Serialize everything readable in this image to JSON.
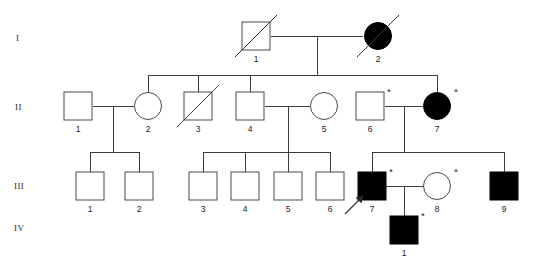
{
  "generation_labels": [
    {
      "id": "gen-I",
      "text": "I",
      "x": 16,
      "y": 41
    },
    {
      "id": "gen-II",
      "text": "II",
      "x": 15,
      "y": 110
    },
    {
      "id": "gen-III",
      "text": "III",
      "x": 14,
      "y": 189
    },
    {
      "id": "gen-IV",
      "text": "IV",
      "x": 14,
      "y": 231
    }
  ],
  "legend": {
    "affected_fill": "#000000",
    "unaffected_fill": "#ffffff",
    "line_color": "#3c3c3c",
    "asterisk_symbol": "*"
  },
  "individuals": [
    {
      "name": "I-1",
      "generation": "I",
      "id_label": "1",
      "sex": "male",
      "affected": false,
      "deceased": true,
      "asterisk": false,
      "proband": false,
      "cx": 256,
      "cy": 36
    },
    {
      "name": "I-2",
      "generation": "I",
      "id_label": "2",
      "sex": "female",
      "affected": true,
      "deceased": true,
      "asterisk": false,
      "proband": false,
      "cx": 378,
      "cy": 36
    },
    {
      "name": "II-1",
      "generation": "II",
      "id_label": "1",
      "sex": "male",
      "affected": false,
      "deceased": false,
      "asterisk": false,
      "proband": false,
      "cx": 78,
      "cy": 106
    },
    {
      "name": "II-2",
      "generation": "II",
      "id_label": "2",
      "sex": "female",
      "affected": false,
      "deceased": false,
      "asterisk": false,
      "proband": false,
      "cx": 148,
      "cy": 106
    },
    {
      "name": "II-3",
      "generation": "II",
      "id_label": "3",
      "sex": "male",
      "affected": false,
      "deceased": true,
      "asterisk": false,
      "proband": false,
      "cx": 198,
      "cy": 106
    },
    {
      "name": "II-4",
      "generation": "II",
      "id_label": "4",
      "sex": "male",
      "affected": false,
      "deceased": false,
      "asterisk": false,
      "proband": false,
      "cx": 250,
      "cy": 106
    },
    {
      "name": "II-5",
      "generation": "II",
      "id_label": "5",
      "sex": "female",
      "affected": false,
      "deceased": false,
      "asterisk": false,
      "proband": false,
      "cx": 324,
      "cy": 106
    },
    {
      "name": "II-6",
      "generation": "II",
      "id_label": "6",
      "sex": "male",
      "affected": false,
      "deceased": false,
      "asterisk": true,
      "proband": false,
      "cx": 370,
      "cy": 106
    },
    {
      "name": "II-7",
      "generation": "II",
      "id_label": "7",
      "sex": "female",
      "affected": true,
      "deceased": false,
      "asterisk": true,
      "proband": false,
      "cx": 437,
      "cy": 106
    },
    {
      "name": "III-1",
      "generation": "III",
      "id_label": "1",
      "sex": "male",
      "affected": false,
      "deceased": false,
      "asterisk": false,
      "proband": false,
      "cx": 90,
      "cy": 186
    },
    {
      "name": "III-2",
      "generation": "III",
      "id_label": "2",
      "sex": "male",
      "affected": false,
      "deceased": false,
      "asterisk": false,
      "proband": false,
      "cx": 139,
      "cy": 186
    },
    {
      "name": "III-3",
      "generation": "III",
      "id_label": "3",
      "sex": "male",
      "affected": false,
      "deceased": false,
      "asterisk": false,
      "proband": false,
      "cx": 203,
      "cy": 186
    },
    {
      "name": "III-4",
      "generation": "III",
      "id_label": "4",
      "sex": "male",
      "affected": false,
      "deceased": false,
      "asterisk": false,
      "proband": false,
      "cx": 245,
      "cy": 186
    },
    {
      "name": "III-5",
      "generation": "III",
      "id_label": "5",
      "sex": "male",
      "affected": false,
      "deceased": false,
      "asterisk": false,
      "proband": false,
      "cx": 288,
      "cy": 186
    },
    {
      "name": "III-6",
      "generation": "III",
      "id_label": "6",
      "sex": "male",
      "affected": false,
      "deceased": false,
      "asterisk": false,
      "proband": false,
      "cx": 330,
      "cy": 186
    },
    {
      "name": "III-7",
      "generation": "III",
      "id_label": "7",
      "sex": "male",
      "affected": true,
      "deceased": false,
      "asterisk": true,
      "proband": true,
      "cx": 372,
      "cy": 186
    },
    {
      "name": "III-8",
      "generation": "III",
      "id_label": "8",
      "sex": "female",
      "affected": false,
      "deceased": false,
      "asterisk": true,
      "proband": false,
      "cx": 437,
      "cy": 186
    },
    {
      "name": "III-9",
      "generation": "III",
      "id_label": "9",
      "sex": "male",
      "affected": true,
      "deceased": false,
      "asterisk": false,
      "proband": false,
      "cx": 504,
      "cy": 186
    },
    {
      "name": "IV-1",
      "generation": "IV",
      "id_label": "1",
      "sex": "male",
      "affected": true,
      "deceased": false,
      "asterisk": true,
      "proband": false,
      "cx": 404,
      "cy": 230
    }
  ],
  "connections": [
    {
      "name": "mating-I1-I2",
      "type": "mating",
      "points": "271,36 363,36"
    },
    {
      "name": "descent-I-sibship",
      "type": "descent",
      "points": "317,36 317,75"
    },
    {
      "name": "sibship-II",
      "type": "sibship",
      "points": "148,75 437,75"
    },
    {
      "name": "drop-II-2",
      "type": "drop",
      "points": "148,75 148,93"
    },
    {
      "name": "drop-II-3",
      "type": "drop",
      "points": "198,75 198,93"
    },
    {
      "name": "drop-II-4",
      "type": "drop",
      "points": "250,75 250,93"
    },
    {
      "name": "drop-II-7",
      "type": "drop",
      "points": "437,75 437,93"
    },
    {
      "name": "mating-II1-II2",
      "type": "mating",
      "points": "93,106 134,106"
    },
    {
      "name": "descent-II1-II2",
      "type": "descent",
      "points": "113,106 113,152"
    },
    {
      "name": "sibship-III-left",
      "type": "sibship",
      "points": "90,152 139,152"
    },
    {
      "name": "drop-III-1",
      "type": "drop",
      "points": "90,152 90,173"
    },
    {
      "name": "drop-III-2",
      "type": "drop",
      "points": "139,152 139,173"
    },
    {
      "name": "mating-II4-II5",
      "type": "mating",
      "points": "265,106 310,106"
    },
    {
      "name": "descent-II4-II5",
      "type": "descent",
      "points": "288,106 288,152"
    },
    {
      "name": "sibship-III-mid",
      "type": "sibship",
      "points": "203,152 330,152"
    },
    {
      "name": "drop-III-3",
      "type": "drop",
      "points": "203,152 203,173"
    },
    {
      "name": "drop-III-4",
      "type": "drop",
      "points": "245,152 245,173"
    },
    {
      "name": "drop-III-5",
      "type": "drop",
      "points": "288,152 288,173"
    },
    {
      "name": "drop-III-6",
      "type": "drop",
      "points": "330,152 330,173"
    },
    {
      "name": "mating-II6-II7",
      "type": "mating",
      "points": "385,106 423,106"
    },
    {
      "name": "descent-II6-II7",
      "type": "descent",
      "points": "404,106 404,152"
    },
    {
      "name": "sibship-III-right",
      "type": "sibship",
      "points": "372,152 504,152"
    },
    {
      "name": "drop-III-7",
      "type": "drop",
      "points": "372,152 372,173"
    },
    {
      "name": "drop-III-9",
      "type": "drop",
      "points": "504,152 504,173"
    },
    {
      "name": "mating-III7-III8",
      "type": "mating",
      "points": "386,186 423,186"
    },
    {
      "name": "descent-III7-III8",
      "type": "descent",
      "points": "404,186 404,218"
    },
    {
      "name": "drop-IV-1",
      "type": "drop",
      "points": "404,218 404,219"
    }
  ],
  "proband_marker": {
    "name": "proband-arrow",
    "target": "III-7",
    "shaft": "345,214 363,196"
  }
}
